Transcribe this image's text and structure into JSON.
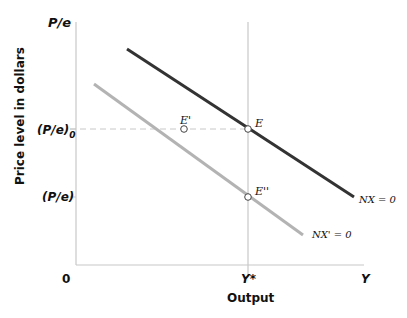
{
  "diagram": {
    "type": "economics-graph",
    "y_axis": {
      "symbol": "P/e",
      "title": "Price level in dollars",
      "ticks": [
        {
          "label": "(P/e)",
          "subscript": "0",
          "level": "upper"
        },
        {
          "label": "(P/e)",
          "subscript": "",
          "level": "lower"
        }
      ]
    },
    "x_axis": {
      "origin": "0",
      "symbol": "Y",
      "title": "Output",
      "ticks": [
        {
          "label": "Y*"
        }
      ]
    },
    "curves": [
      {
        "name": "NX = 0",
        "color": "#333333",
        "from": [
          127,
          49
        ],
        "to": [
          354,
          197
        ]
      },
      {
        "name": "NX' = 0",
        "color": "#b3b3b3",
        "from": [
          94,
          84
        ],
        "to": [
          303,
          235
        ]
      }
    ],
    "points": [
      {
        "label": "E",
        "x": 248,
        "y": 129
      },
      {
        "label": "E'",
        "x": 184,
        "y": 129
      },
      {
        "label": "E''",
        "x": 248,
        "y": 197
      }
    ],
    "colors": {
      "axis": "#c8c8c8",
      "dashed_guide": "#c8c8c8",
      "curve_dark": "#333333",
      "curve_light": "#b3b3b3"
    }
  }
}
